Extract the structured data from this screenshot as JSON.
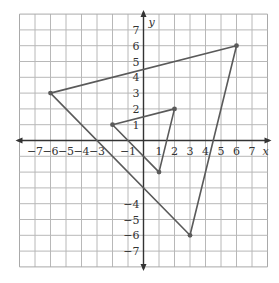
{
  "chart_data": {
    "type": "coordinate-plane",
    "title": "",
    "xlabel": "x",
    "ylabel": "y",
    "xlim": [
      -8,
      8
    ],
    "ylim": [
      -8,
      8
    ],
    "grid": true,
    "x_tick_labels": [
      "−7",
      "−6",
      "−5",
      "−4",
      "−3",
      "−1",
      "1",
      "2",
      "3",
      "4",
      "5",
      "6",
      "7"
    ],
    "x_tick_values": [
      -7,
      -6,
      -5,
      -4,
      -3,
      -1,
      1,
      2,
      3,
      4,
      5,
      6,
      7
    ],
    "y_tick_labels": [
      "7",
      "6",
      "5",
      "4",
      "3",
      "2",
      "1",
      "−4",
      "−5",
      "−6",
      "−7"
    ],
    "y_tick_values": [
      7,
      6,
      5,
      4,
      3,
      2,
      1,
      -4,
      -5,
      -6,
      -7
    ],
    "shapes": [
      {
        "name": "large-triangle",
        "vertices": [
          [
            -6,
            3
          ],
          [
            6,
            6
          ],
          [
            3,
            -6
          ]
        ]
      },
      {
        "name": "small-triangle",
        "vertices": [
          [
            -2,
            1
          ],
          [
            2,
            2
          ],
          [
            1,
            -2
          ]
        ]
      }
    ]
  },
  "style": {
    "grid_color": "#b8b8b8",
    "border_color": "#a9a9a9",
    "axis_color": "#333333",
    "shape_color": "#5a5a5a",
    "background": "#ffffff"
  }
}
